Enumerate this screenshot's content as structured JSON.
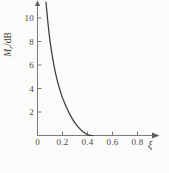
{
  "figure": {
    "name": "resonant-peak-vs-damping-ratio-curve",
    "background_color": "#fbfbfa",
    "curve_color": "#3d3d3b",
    "axis_color": "#7a7a78"
  },
  "chart_data": {
    "type": "line",
    "title": "",
    "subtitle": "",
    "xlabel": "ξ",
    "ylabel": "Mᵣ/dB",
    "ylabel_symbol": "M",
    "ylabel_subscript": "r",
    "ylabel_unit": "/dB",
    "xlim": [
      0,
      0.9
    ],
    "ylim": [
      0,
      11.6
    ],
    "xticks": [
      0,
      0.2,
      0.4,
      0.6,
      0.8
    ],
    "xtick_labels": [
      "0",
      "0.2",
      "0.4",
      "0.6",
      "0.8"
    ],
    "yticks": [
      2,
      4,
      6,
      8,
      10
    ],
    "ytick_labels": [
      "2",
      "4",
      "6",
      "8",
      "10"
    ],
    "grid": false,
    "legend": null,
    "x_axis_arrow": true,
    "y_axis_arrow": true,
    "series": [
      {
        "name": "Mᵣ(ξ)",
        "x": [
          0.068,
          0.08,
          0.09,
          0.1,
          0.12,
          0.14,
          0.16,
          0.18,
          0.2,
          0.22,
          0.25,
          0.28,
          0.3,
          0.33,
          0.36,
          0.4,
          0.44,
          0.48,
          0.52,
          0.56,
          0.6,
          0.64,
          0.68,
          0.7,
          0.707
        ],
        "y": [
          11.35,
          9.94,
          8.92,
          8.05,
          6.61,
          5.49,
          4.59,
          3.84,
          3.2,
          2.66,
          1.96,
          1.39,
          1.07,
          0.66,
          0.34,
          0.04,
          0.0,
          0.0,
          0.0,
          0.0,
          0.0,
          0.0,
          0.0,
          0.0,
          0.0
        ],
        "y_exact_note": "",
        "color": "#3d3d3b"
      }
    ],
    "annotations": []
  }
}
